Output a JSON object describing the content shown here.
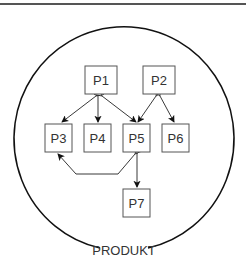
{
  "diagram": {
    "container_label": "PRODUKT",
    "nodes": [
      {
        "id": "P1",
        "label": "P1",
        "x": 85,
        "y": 66,
        "w": 32,
        "h": 28
      },
      {
        "id": "P2",
        "label": "P2",
        "x": 143,
        "y": 66,
        "w": 32,
        "h": 28
      },
      {
        "id": "P3",
        "label": "P3",
        "x": 45,
        "y": 124,
        "w": 27,
        "h": 28
      },
      {
        "id": "P4",
        "label": "P4",
        "x": 84,
        "y": 124,
        "w": 27,
        "h": 28
      },
      {
        "id": "P5",
        "label": "P5",
        "x": 123,
        "y": 124,
        "w": 27,
        "h": 28
      },
      {
        "id": "P6",
        "label": "P6",
        "x": 162,
        "y": 124,
        "w": 27,
        "h": 28
      },
      {
        "id": "P7",
        "label": "P7",
        "x": 123,
        "y": 189,
        "w": 27,
        "h": 28
      }
    ],
    "edges": [
      {
        "from": "P1",
        "to": "P3"
      },
      {
        "from": "P1",
        "to": "P4"
      },
      {
        "from": "P1",
        "to": "P5"
      },
      {
        "from": "P2",
        "to": "P5"
      },
      {
        "from": "P2",
        "to": "P6"
      },
      {
        "from": "P5",
        "to": "P3"
      },
      {
        "from": "P5",
        "to": "P7"
      }
    ],
    "colors": {
      "stroke": "#222222",
      "box": "#555555",
      "text": "#333333"
    }
  }
}
